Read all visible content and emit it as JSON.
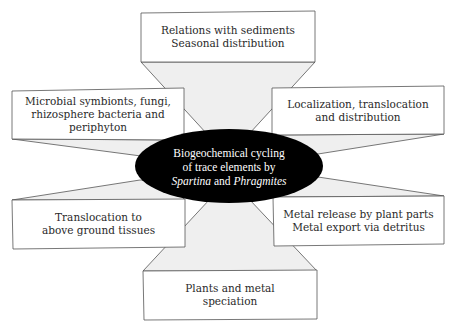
{
  "diagram": {
    "type": "hub-and-spoke",
    "center": {
      "line1": "Biogeochemical cycling",
      "line2": "of trace elements by",
      "line3_genus1": "Spartina",
      "line3_conj": " and ",
      "line3_genus2": "Phragmites",
      "fill": "#000000",
      "text_color": "#ffffff"
    },
    "nodes": [
      {
        "id": "top",
        "text": "Relations with sediments\nSeasonal distribution"
      },
      {
        "id": "upper-left",
        "text": "Microbial symbionts, fungi,\nrhizosphere bacteria and\nperiphyton"
      },
      {
        "id": "upper-right",
        "text": "Localization, translocation\nand distribution"
      },
      {
        "id": "lower-left",
        "text": "Translocation to\nabove ground tissues"
      },
      {
        "id": "lower-right",
        "text": "Metal release by plant parts\nMetal export via detritus"
      },
      {
        "id": "bottom",
        "text": "Plants and metal\nspeciation"
      }
    ],
    "colors": {
      "connector_fill": "#efefef",
      "box_fill": "#ffffff",
      "stroke": "#555555"
    }
  }
}
